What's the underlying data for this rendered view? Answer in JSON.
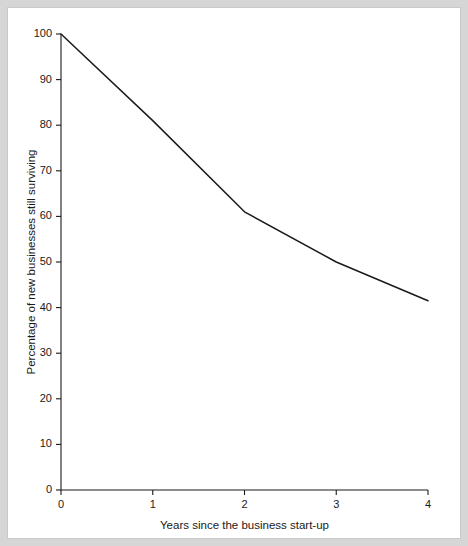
{
  "figure": {
    "background_color": "#d6d6d6",
    "panel_color": "#ffffff",
    "line_color": "#1a1a1a",
    "axis_color": "#1a1a1a"
  },
  "chart_data": {
    "type": "line",
    "title": "",
    "xlabel": "Years since the business start-up",
    "ylabel": "Percentage of new businesses still surviving",
    "x": [
      0,
      1,
      2,
      3,
      4
    ],
    "values": [
      100,
      81,
      61,
      50,
      41.5
    ],
    "series": [
      {
        "name": "Percentage of new businesses still surviving",
        "values": [
          100,
          81,
          61,
          50,
          41.5
        ]
      }
    ],
    "xlim": [
      0,
      4
    ],
    "ylim": [
      0,
      100
    ],
    "xticks": [
      0,
      1,
      2,
      3,
      4
    ],
    "xticklabels": [
      "0",
      "1",
      "2",
      "3",
      "4"
    ],
    "yticks": [
      0,
      10,
      20,
      30,
      40,
      50,
      60,
      70,
      80,
      90,
      100
    ],
    "yticklabels": [
      "0",
      "10",
      "20",
      "30",
      "40",
      "50",
      "60",
      "70",
      "80",
      "90",
      "100"
    ],
    "grid": false,
    "legend": false,
    "markers": false
  }
}
